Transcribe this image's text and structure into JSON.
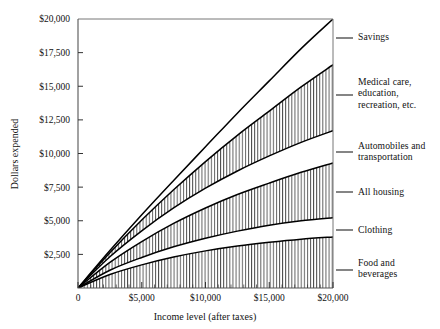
{
  "chart_data": {
    "type": "area",
    "title": "",
    "subtitle": "",
    "xlabel": "Income level (after taxes)",
    "ylabel": "Dollars expended",
    "xlim": [
      0,
      20000
    ],
    "ylim": [
      0,
      20000
    ],
    "grid": false,
    "legend_position": "right-outside",
    "stacked": true,
    "x_ticklabels": [
      "0",
      "$5,000",
      "$10,000",
      "$15,000",
      "$20,000"
    ],
    "x_tickvalues": [
      0,
      5000,
      10000,
      15000,
      20000
    ],
    "y_ticklabels": [
      "$2,500",
      "$5,000",
      "$7,500",
      "$10,000",
      "$12,500",
      "$15,000",
      "$17,500",
      "$20,000"
    ],
    "y_tickvalues": [
      2500,
      5000,
      7500,
      10000,
      12500,
      15000,
      17500,
      20000
    ],
    "x": [
      0,
      2500,
      5000,
      7500,
      10000,
      12500,
      15000,
      17500,
      20000
    ],
    "series": [
      {
        "name": "Food and beverages",
        "label": "Food and\nbeverages",
        "hatched": true,
        "cumulative": [
          0,
          1000,
          1720,
          2300,
          2760,
          3120,
          3400,
          3630,
          3800
        ]
      },
      {
        "name": "Clothing",
        "label": "Clothing",
        "hatched": false,
        "cumulative": [
          0,
          1320,
          2270,
          3060,
          3700,
          4230,
          4670,
          5000,
          5230
        ]
      },
      {
        "name": "All housing",
        "label": "All housing",
        "hatched": true,
        "cumulative": [
          0,
          1900,
          3450,
          4800,
          5950,
          6950,
          7800,
          8600,
          9300
        ]
      },
      {
        "name": "Automobiles and transportation",
        "label": "Automobiles and\ntransportation",
        "hatched": false,
        "cumulative": [
          0,
          2320,
          4250,
          5950,
          7420,
          8700,
          9820,
          10830,
          11700
        ]
      },
      {
        "name": "Medical care, education, recreation, etc.",
        "label": "Medical care,\neducation,\nrecreation, etc.",
        "hatched": true,
        "cumulative": [
          0,
          2620,
          5050,
          7300,
          9400,
          11350,
          13150,
          14950,
          16600
        ]
      },
      {
        "name": "Savings",
        "label": "Savings",
        "hatched": false,
        "cumulative": [
          0,
          2780,
          5450,
          8000,
          10500,
          13000,
          15400,
          17800,
          20000
        ]
      }
    ]
  },
  "labels": {
    "savings": "Savings",
    "medical": "Medical care,\neducation,\nrecreation, etc.",
    "automobiles": "Automobiles and\ntransportation",
    "housing": "All housing",
    "clothing": "Clothing",
    "food": "Food and\nbeverages"
  },
  "axes": {
    "y_title": "Dollars expended",
    "x_title": "Income level (after taxes)"
  }
}
